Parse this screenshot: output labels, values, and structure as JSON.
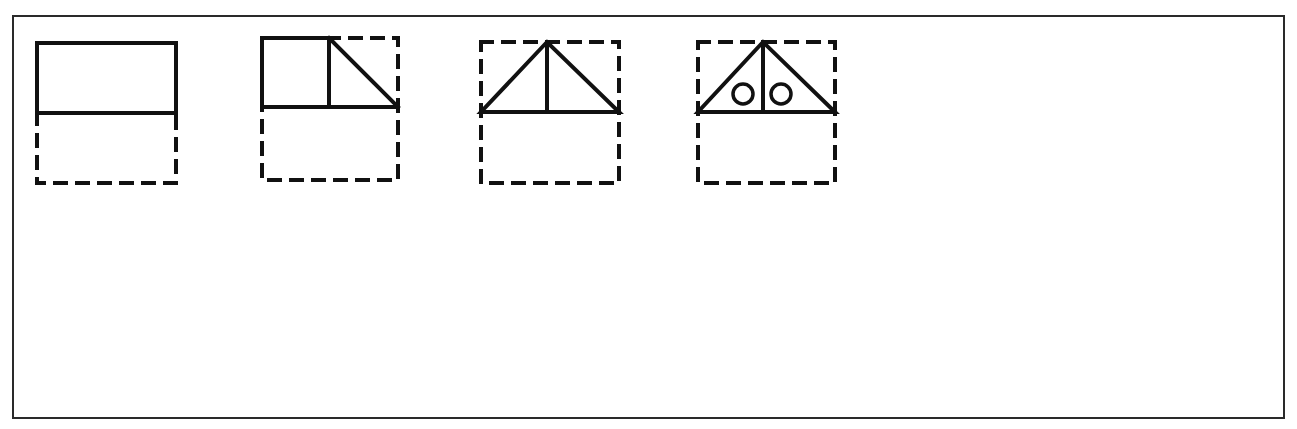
{
  "puzzle": {
    "type": "spatial-reasoning",
    "top_row": [
      {
        "id": "fig1",
        "description": "solid rectangle occupying top half of a dashed tall rectangle",
        "circles": 0
      },
      {
        "id": "fig2",
        "description": "solid square plus right triangle in top half of dashed square",
        "circles": 0
      },
      {
        "id": "fig3",
        "description": "isosceles triangle with vertical center line in top half of dashed square",
        "circles": 0
      },
      {
        "id": "fig4",
        "description": "isosceles triangle with vertical center line and two small circles in top half of dashed square",
        "circles": 2
      }
    ],
    "options": [
      {
        "label": "A",
        "grid": [
          [
            1,
            0,
            0,
            1
          ],
          [
            0,
            1,
            0,
            0
          ],
          [
            0,
            0,
            0,
            0
          ],
          [
            1,
            0,
            0,
            1
          ]
        ]
      },
      {
        "label": "B",
        "grid": [
          [
            1,
            0,
            0,
            1
          ],
          [
            0,
            1,
            1,
            0
          ],
          [
            0,
            1,
            1,
            0
          ],
          [
            1,
            0,
            0,
            1
          ]
        ]
      },
      {
        "label": "C",
        "grid": [
          [
            1,
            0,
            0,
            1
          ],
          [
            0,
            1,
            1,
            0
          ],
          [
            0,
            0,
            0,
            0
          ],
          [
            0,
            0,
            0,
            0
          ]
        ]
      },
      {
        "label": "D",
        "grid": [
          [
            1,
            0,
            0,
            0
          ],
          [
            0,
            1,
            0,
            0
          ],
          [
            0,
            1,
            0,
            0
          ],
          [
            1,
            0,
            0,
            0
          ]
        ]
      },
      {
        "label": "E",
        "grid": [
          [
            1,
            0,
            0,
            0
          ],
          [
            0,
            1,
            0,
            0
          ],
          [
            0,
            0,
            1,
            0
          ],
          [
            0,
            0,
            0,
            1
          ]
        ]
      }
    ]
  },
  "colors": {
    "ink": "#111111",
    "frame": "#2a2a2a",
    "background": "#ffffff"
  }
}
